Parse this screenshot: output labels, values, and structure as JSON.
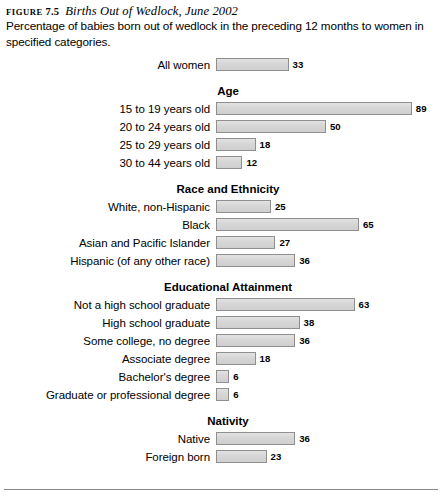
{
  "figure": {
    "label_word": "FIGURE",
    "label_number": "7.5",
    "title": "Births Out of Wedlock, June 2002",
    "subtitle": "Percentage of babies born out of wedlock in the preceding 12 months to women in specified categories."
  },
  "chart_data": {
    "type": "bar",
    "title": "Births Out of Wedlock, June 2002",
    "subtitle": "Percentage of babies born out of wedlock in the preceding 12 months to women in specified categories.",
    "orientation": "horizontal",
    "xlabel": "",
    "ylabel": "",
    "xlim": [
      0,
      89
    ],
    "grid": false,
    "legend": null,
    "value_unit": "percent",
    "bar_fill_color": "#d8d8d8",
    "bar_border_color": "#8f8f8f",
    "categories": [
      "All women",
      "15 to 19 years old",
      "20 to 24 years old",
      "25 to 29 years old",
      "30 to 44 years old",
      "White, non-Hispanic",
      "Black",
      "Asian and Pacific Islander",
      "Hispanic (of any other race)",
      "Not a high school graduate",
      "High school graduate",
      "Some college, no degree",
      "Associate degree",
      "Bachelor's degree",
      "Graduate or professional degree",
      "Native",
      "Foreign born"
    ],
    "values": [
      33,
      89,
      50,
      18,
      12,
      25,
      65,
      27,
      36,
      63,
      38,
      36,
      18,
      6,
      6,
      36,
      23
    ],
    "groups": [
      {
        "title": "",
        "rows": [
          {
            "label": "All women",
            "value": 33
          }
        ]
      },
      {
        "title": "Age",
        "rows": [
          {
            "label": "15 to 19 years old",
            "value": 89
          },
          {
            "label": "20 to 24 years old",
            "value": 50
          },
          {
            "label": "25 to 29 years old",
            "value": 18
          },
          {
            "label": "30 to 44 years old",
            "value": 12
          }
        ]
      },
      {
        "title": "Race and Ethnicity",
        "rows": [
          {
            "label": "White, non-Hispanic",
            "value": 25
          },
          {
            "label": "Black",
            "value": 65
          },
          {
            "label": "Asian and Pacific Islander",
            "value": 27
          },
          {
            "label": "Hispanic (of any other race)",
            "value": 36
          }
        ]
      },
      {
        "title": "Educational Attainment",
        "rows": [
          {
            "label": "Not a high school graduate",
            "value": 63
          },
          {
            "label": "High school graduate",
            "value": 38
          },
          {
            "label": "Some college, no degree",
            "value": 36
          },
          {
            "label": "Associate degree",
            "value": 18
          },
          {
            "label": "Bachelor's degree",
            "value": 6
          },
          {
            "label": "Graduate or professional degree",
            "value": 6
          }
        ]
      },
      {
        "title": "Nativity",
        "rows": [
          {
            "label": "Native",
            "value": 36
          },
          {
            "label": "Foreign born",
            "value": 23
          }
        ]
      }
    ]
  },
  "layout": {
    "bar_origin_px": 216,
    "px_per_unit": 2.2
  }
}
